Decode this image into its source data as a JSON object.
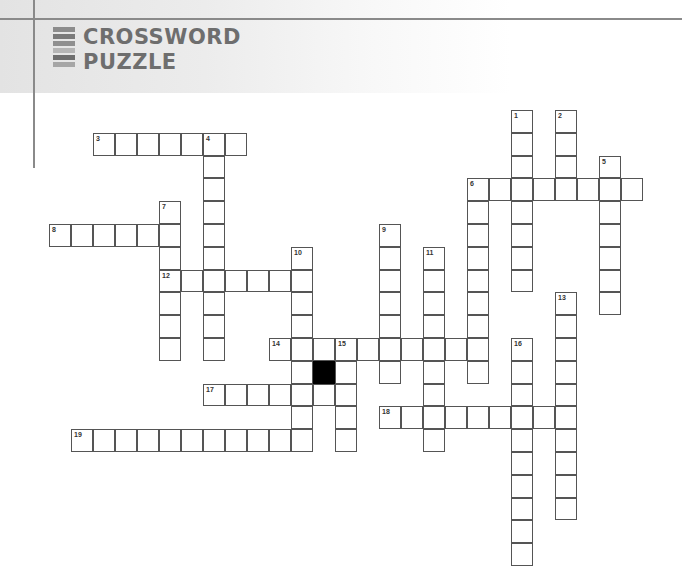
{
  "header": {
    "title_line1": "CROSSWORD",
    "title_line2": "PUZZLE",
    "bar_colors": [
      "#8c8c8c",
      "#7a7a7a",
      "#8f8f8f",
      "#b5b5b5",
      "#6e6e6e",
      "#a6a6a6"
    ]
  },
  "puzzle": {
    "entries": [
      {
        "number": "1",
        "direction": "down",
        "col": 21,
        "row": 0,
        "length": 8
      },
      {
        "number": "2",
        "direction": "down",
        "col": 23,
        "row": 0,
        "length": 4
      },
      {
        "number": "3",
        "direction": "across",
        "col": 2,
        "row": 1,
        "length": 7
      },
      {
        "number": "4",
        "direction": "down",
        "col": 7,
        "row": 1,
        "length": 10
      },
      {
        "number": "5",
        "direction": "down",
        "col": 25,
        "row": 2,
        "length": 7
      },
      {
        "number": "6",
        "direction": "across",
        "col": 19,
        "row": 3,
        "length": 8
      },
      {
        "number": "6",
        "direction": "down",
        "col": 19,
        "row": 3,
        "length": 9
      },
      {
        "number": "7",
        "direction": "down",
        "col": 5,
        "row": 4,
        "length": 7
      },
      {
        "number": "8",
        "direction": "across",
        "col": 0,
        "row": 5,
        "length": 6
      },
      {
        "number": "9",
        "direction": "down",
        "col": 15,
        "row": 5,
        "length": 7
      },
      {
        "number": "10",
        "direction": "down",
        "col": 11,
        "row": 6,
        "length": 8
      },
      {
        "number": "11",
        "direction": "down",
        "col": 17,
        "row": 6,
        "length": 9
      },
      {
        "number": "12",
        "direction": "across",
        "col": 5,
        "row": 7,
        "length": 7
      },
      {
        "number": "13",
        "direction": "down",
        "col": 23,
        "row": 8,
        "length": 10
      },
      {
        "number": "14",
        "direction": "across",
        "col": 10,
        "row": 10,
        "length": 10
      },
      {
        "number": "15",
        "direction": "down",
        "col": 13,
        "row": 10,
        "length": 5
      },
      {
        "number": "16",
        "direction": "down",
        "col": 21,
        "row": 10,
        "length": 10
      },
      {
        "number": "17",
        "direction": "across",
        "col": 7,
        "row": 12,
        "length": 7
      },
      {
        "number": "18",
        "direction": "across",
        "col": 15,
        "row": 13,
        "length": 9
      },
      {
        "number": "19",
        "direction": "across",
        "col": 1,
        "row": 14,
        "length": 11
      }
    ],
    "black_cells": [
      {
        "col": 12,
        "row": 11
      }
    ]
  }
}
